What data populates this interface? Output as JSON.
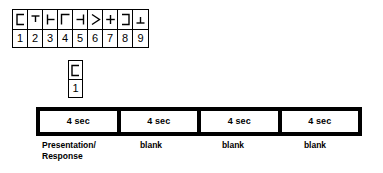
{
  "figure": {
    "stimulus_grid": {
      "name": "symbol-digit-code-key",
      "symbols": [
        {
          "index": 1,
          "icon": "bracket-open-right-symbol",
          "digit": "1"
        },
        {
          "index": 2,
          "icon": "tee-down-symbol",
          "digit": "2"
        },
        {
          "index": 3,
          "icon": "turnstile-right-symbol",
          "digit": "3"
        },
        {
          "index": 4,
          "icon": "gamma-corner-symbol",
          "digit": "4"
        },
        {
          "index": 5,
          "icon": "turnstile-left-symbol",
          "digit": "5"
        },
        {
          "index": 6,
          "icon": "greater-than-symbol",
          "digit": "6"
        },
        {
          "index": 7,
          "icon": "plus-symbol",
          "digit": "7"
        },
        {
          "index": 8,
          "icon": "bracket-open-left-symbol",
          "digit": "8"
        },
        {
          "index": 9,
          "icon": "up-tack-symbol",
          "digit": "9"
        }
      ]
    },
    "probe_item": {
      "name": "probe-symbol-cell",
      "icon": "bracket-open-right-symbol",
      "digit": "1"
    },
    "timeline": {
      "segments": [
        {
          "duration": "4 sec",
          "caption": "Presentation/\nResponse"
        },
        {
          "duration": "4 sec",
          "caption": "blank"
        },
        {
          "duration": "4 sec",
          "caption": "blank"
        },
        {
          "duration": "4 sec",
          "caption": "blank"
        }
      ],
      "caption_line1": "Presentation/",
      "caption_line2": "Response"
    },
    "colors": {
      "ink": "#000000",
      "paper": "#ffffff"
    }
  }
}
